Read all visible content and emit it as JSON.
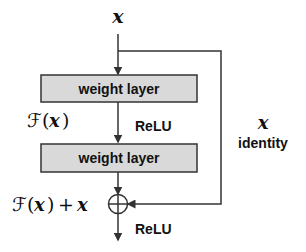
{
  "diagram": {
    "input_label": "x",
    "blocks": [
      {
        "label": "weight layer"
      },
      {
        "label": "weight layer"
      }
    ],
    "activation_between": "ReLU",
    "activation_after": "ReLU",
    "residual_label": "F(x)",
    "residual_script_F": "ℱ",
    "sum_label_F": "ℱ",
    "sum_label_rest": "(x) + x",
    "shortcut": {
      "label_x": "x",
      "label_text": "identity"
    },
    "colors": {
      "box_fill": "#d9d9d9",
      "stroke": "#333333",
      "text": "#111111"
    }
  }
}
